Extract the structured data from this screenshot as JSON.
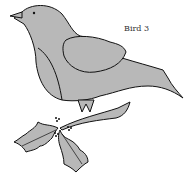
{
  "illustration": {
    "title": "Bird 3",
    "subject": "bird perched on holly branch",
    "fill_color": "#b8b8b8",
    "stroke_color": "#111111",
    "background": "#ffffff"
  }
}
